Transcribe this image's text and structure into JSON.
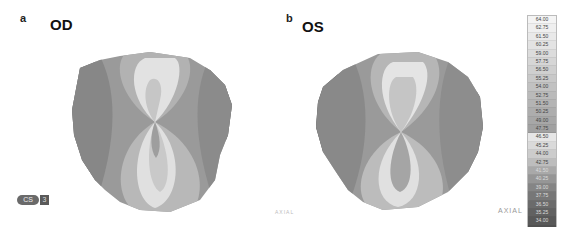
{
  "panels": [
    {
      "letter": "a",
      "eye": "OD"
    },
    {
      "letter": "b",
      "eye": "OS"
    }
  ],
  "map_type_label": "AXIAL",
  "logo": {
    "text": "CS",
    "badge": "3"
  },
  "scale": {
    "values": [
      "64.00",
      "62.75",
      "61.50",
      "60.25",
      "59.00",
      "57.75",
      "56.50",
      "55.25",
      "54.00",
      "52.75",
      "51.50",
      "50.25",
      "49.00",
      "47.75",
      "46.50",
      "45.25",
      "44.00",
      "42.75",
      "41.50",
      "40.25",
      "39.00",
      "37.75",
      "36.50",
      "35.25",
      "34.00",
      "32.75"
    ],
    "colors": [
      "#f4f4f4",
      "#efefef",
      "#e9e9e9",
      "#e3e3e3",
      "#dcdcdc",
      "#d6d6d6",
      "#cfcfcf",
      "#c8c8c8",
      "#c1c1c1",
      "#bababa",
      "#b4b4b4",
      "#adadad",
      "#a7a7a7",
      "#a1a1a1",
      "#e6e6e6",
      "#dadada",
      "#cccccc",
      "#bdbdbd",
      "#a9a9a9",
      "#969696",
      "#858585",
      "#777777",
      "#6b6b6b",
      "#616161",
      "#585858",
      "#505050"
    ]
  }
}
